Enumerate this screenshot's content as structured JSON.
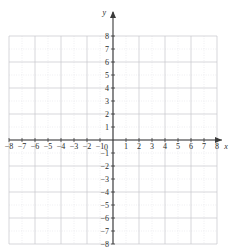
{
  "chart_data": {
    "type": "scatter",
    "title": "",
    "subtitle": "",
    "xlabel": "x",
    "ylabel": "y",
    "xlim": [
      -8,
      8
    ],
    "ylim": [
      -8,
      8
    ],
    "grid": true,
    "legend": null,
    "series": [],
    "values": [],
    "x": [],
    "annotations": [],
    "x_tick_labels": [
      "−8",
      "−7",
      "−6",
      "−5",
      "−4",
      "−3",
      "−2",
      "−1",
      "1",
      "2",
      "3",
      "4",
      "5",
      "6",
      "7",
      "8"
    ],
    "y_tick_labels": [
      "8",
      "7",
      "6",
      "5",
      "4",
      "3",
      "2",
      "1",
      "−1",
      "−2",
      "−3",
      "−4",
      "−5",
      "−6",
      "−7",
      "−8"
    ],
    "origin_label": "0",
    "x_tick_values": [
      -8,
      -7,
      -6,
      -5,
      -4,
      -3,
      -2,
      -1,
      1,
      2,
      3,
      4,
      5,
      6,
      7,
      8
    ],
    "y_tick_values": [
      8,
      7,
      6,
      5,
      4,
      3,
      2,
      1,
      -1,
      -2,
      -3,
      -4,
      -5,
      -6,
      -7,
      -8
    ],
    "minor_grid_step": 1,
    "major_grid_step": 2,
    "colors": {
      "background": "#ffffff",
      "axis": "#3a3a3a",
      "major_grid": "#c9c9cf",
      "minor_grid": "#dedee4",
      "label": "#2b2b2b"
    }
  },
  "graph": {
    "axes": {
      "x_axis_name": "x",
      "y_axis_name": "y",
      "origin_label": "0"
    }
  }
}
